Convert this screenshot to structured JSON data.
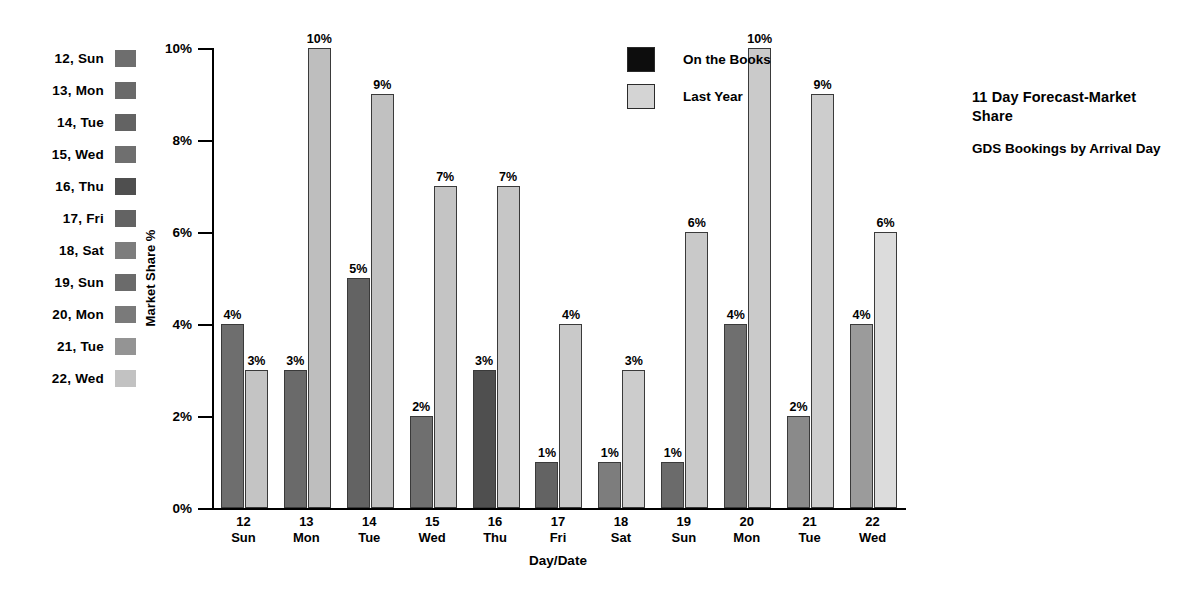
{
  "chart_data": {
    "type": "bar",
    "title": "11 Day Forecast-Market Share",
    "subtitle": "GDS Bookings by Arrival Day",
    "xlabel": "Day/Date",
    "ylabel": "Market Share %",
    "ylim": [
      0,
      10
    ],
    "ytick_labels": [
      "0%",
      "2%",
      "4%",
      "6%",
      "8%",
      "10%"
    ],
    "ytick_values": [
      0,
      2,
      4,
      6,
      8,
      10
    ],
    "grid": false,
    "legend_position": "inside-top-center",
    "categories": [
      "12 Sun",
      "13 Mon",
      "14 Tue",
      "15 Wed",
      "16 Thu",
      "17 Fri",
      "18 Sat",
      "19 Sun",
      "20 Mon",
      "21 Tue",
      "22 Wed"
    ],
    "category_lines": [
      {
        "day_num": "12",
        "day_name": "Sun"
      },
      {
        "day_num": "13",
        "day_name": "Mon"
      },
      {
        "day_num": "14",
        "day_name": "Tue"
      },
      {
        "day_num": "15",
        "day_name": "Wed"
      },
      {
        "day_num": "16",
        "day_name": "Thu"
      },
      {
        "day_num": "17",
        "day_name": "Fri"
      },
      {
        "day_num": "18",
        "day_name": "Sat"
      },
      {
        "day_num": "19",
        "day_name": "Sun"
      },
      {
        "day_num": "20",
        "day_name": "Mon"
      },
      {
        "day_num": "21",
        "day_name": "Tue"
      },
      {
        "day_num": "22",
        "day_name": "Wed"
      }
    ],
    "series": [
      {
        "name": "On the Books",
        "color": "#6d6d6d",
        "values": [
          4,
          3,
          5,
          2,
          3,
          1,
          1,
          1,
          4,
          2,
          4
        ],
        "value_labels": [
          "4%",
          "3%",
          "5%",
          "2%",
          "3%",
          "1%",
          "1%",
          "1%",
          "4%",
          "2%",
          "4%"
        ],
        "bar_colors": [
          "#6e6e6e",
          "#6a6a6a",
          "#636363",
          "#6f6f6f",
          "#4f4f4f",
          "#636363",
          "#7d7d7d",
          "#6b6b6b",
          "#6f6f6f",
          "#8a8a8a",
          "#9b9b9b"
        ]
      },
      {
        "name": "Last Year",
        "color": "#c9c9c9",
        "values": [
          3,
          10,
          9,
          7,
          7,
          4,
          3,
          6,
          10,
          9,
          6
        ],
        "value_labels": [
          "3%",
          "10%",
          "9%",
          "7%",
          "7%",
          "4%",
          "3%",
          "6%",
          "10%",
          "9%",
          "6%"
        ],
        "bar_colors": [
          "#c4c4c4",
          "#bebebe",
          "#c1c1c1",
          "#c4c4c4",
          "#c6c6c6",
          "#c9c9c9",
          "#cccccc",
          "#c9c9c9",
          "#cacaca",
          "#cdcdcd",
          "#dcdcdc"
        ]
      }
    ],
    "date_legend": [
      {
        "label": "12, Sun",
        "color": "#6e6e6e"
      },
      {
        "label": "13, Mon",
        "color": "#6a6a6a"
      },
      {
        "label": "14, Tue",
        "color": "#636363"
      },
      {
        "label": "15, Wed",
        "color": "#6f6f6f"
      },
      {
        "label": "16, Thu",
        "color": "#4f4f4f"
      },
      {
        "label": "17, Fri",
        "color": "#636363"
      },
      {
        "label": "18, Sat",
        "color": "#7d7d7d"
      },
      {
        "label": "19, Sun",
        "color": "#6b6b6b"
      },
      {
        "label": "20, Mon",
        "color": "#7a7a7a"
      },
      {
        "label": "21, Tue",
        "color": "#949494"
      },
      {
        "label": "22, Wed",
        "color": "#c2c2c2"
      }
    ],
    "series_legend": [
      {
        "label": "On the Books",
        "color": "#0d0d0d"
      },
      {
        "label": "Last Year",
        "color": "#d4d4d4"
      }
    ]
  }
}
